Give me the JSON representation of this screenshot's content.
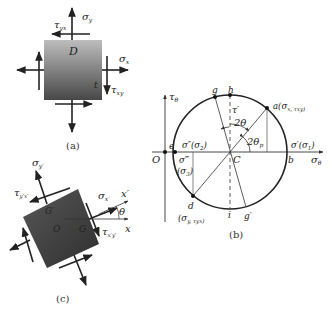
{
  "panel_a": {
    "caption": "(a)",
    "point_D": "D",
    "point_t": "t",
    "sigma_y": "σ",
    "sigma_y_sub": "y",
    "sigma_x": "σ",
    "sigma_x_sub": "x",
    "tau_yx": "τ",
    "tau_yx_sub": "yx",
    "tau_xy": "τ",
    "tau_xy_sub": "xy"
  },
  "panel_b": {
    "caption": "(b)",
    "axis_tau": "τ",
    "axis_tau_sub": "θ",
    "axis_sigma": "σ",
    "axis_sigma_sub": "θ",
    "origin": "O",
    "center": "C",
    "pt_e": "e",
    "pt_b": "b",
    "pt_g": "g",
    "pt_h": "h",
    "pt_i": "i",
    "pt_gprime": "g′",
    "pt_a": "a(σ",
    "pt_a_rest": "x, τ",
    "pt_a_end": "xy)",
    "pt_d": "d",
    "pt_d_coords": "(σ",
    "pt_d_rest": "y, τ",
    "pt_d_end": "yx)",
    "sigma_prime_s1": "σ′(σ",
    "sigma_prime_s1_sub": "1",
    "sigma_dprime_s2": "σ″(σ",
    "sigma_dprime_s2_sub": "2",
    "sigma_tprime": "σ‴",
    "sigma_s3": "(σ",
    "sigma_s3_sub": "3",
    "tau_prime": "τ′",
    "angle_2theta": "2θ",
    "angle_2theta_p": "2θ",
    "angle_2theta_p_sub": "p"
  },
  "panel_c": {
    "caption": "(c)",
    "sigma_y_prime": "σ",
    "sigma_y_prime_sub": "y′",
    "sigma_x_prime": "σ",
    "sigma_x_prime_sub": "x′",
    "tau_yx_prime": "τ",
    "tau_yx_prime_sub": "y′x′",
    "tau_xy_prime": "τ",
    "tau_xy_prime_sub": "x′y′",
    "axis_x_prime": "x′",
    "axis_x": "x",
    "angle_theta": "θ",
    "point_G_prime": "G′",
    "point_O": "O",
    "point_G": "G"
  },
  "colors": {
    "ink": "#222222",
    "square_top": "#b9b9b9",
    "square_bottom": "#4a4a4a",
    "square_dark": "#3c3c3c"
  }
}
